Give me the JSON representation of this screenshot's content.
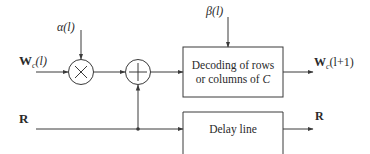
{
  "diagram": {
    "inputs": {
      "w_label_main": "W",
      "w_label_sub": "c",
      "w_label_arg": "(l)",
      "r_label": "R"
    },
    "weights": {
      "alpha_label": "α(l)",
      "beta_label": "β(l)"
    },
    "nodes": {
      "multiplier_symbol": "×",
      "adder_symbol": "+"
    },
    "blocks": {
      "decoder_line1": "Decoding of rows",
      "decoder_line2_prefix": "or columns of ",
      "decoder_line2_var": "C",
      "delay_label": "Delay line"
    },
    "outputs": {
      "w_label_main": "W",
      "w_label_sub": "c",
      "w_label_arg": "(l+1)",
      "r_label": "R"
    },
    "colors": {
      "stroke": "#3a3a3a",
      "text": "#2a2a2a",
      "background": "#ffffff"
    }
  }
}
